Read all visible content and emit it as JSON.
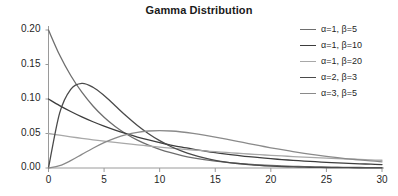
{
  "chart_data": {
    "type": "line",
    "title": "Gamma Distribution",
    "xlabel": "",
    "ylabel": "",
    "xlim": [
      0,
      30
    ],
    "ylim": [
      0,
      0.2
    ],
    "grid": false,
    "legend_position": "right",
    "xticks": [
      "0",
      "5",
      "10",
      "15",
      "20",
      "25",
      "30"
    ],
    "xtick_values": [
      0,
      5,
      10,
      15,
      20,
      25,
      30
    ],
    "yticks": [
      "0.00",
      "0.05",
      "0.10",
      "0.15",
      "0.20"
    ],
    "ytick_values": [
      0.0,
      0.05,
      0.1,
      0.15,
      0.2
    ],
    "x": [
      0,
      1,
      2,
      3,
      4,
      5,
      6,
      7,
      8,
      9,
      10,
      11,
      12,
      13,
      14,
      15,
      16,
      17,
      18,
      19,
      20,
      21,
      22,
      23,
      24,
      25,
      26,
      27,
      28,
      29,
      30
    ],
    "series": [
      {
        "name": "α=1, β=5",
        "color": "#6e6e6e",
        "values": [
          0.2,
          0.1637,
          0.134,
          0.1098,
          0.0899,
          0.0736,
          0.0602,
          0.0493,
          0.0404,
          0.0331,
          0.0271,
          0.0222,
          0.0181,
          0.0148,
          0.0122,
          0.01,
          0.0082,
          0.0067,
          0.0055,
          0.0045,
          0.0037,
          0.003,
          0.0025,
          0.002,
          0.0016,
          0.0013,
          0.0011,
          0.0009,
          0.0007,
          0.0006,
          0.0005
        ]
      },
      {
        "name": "α=1, β=10",
        "color": "#3d3d3d",
        "values": [
          0.1,
          0.0905,
          0.0819,
          0.0741,
          0.067,
          0.0607,
          0.0549,
          0.0497,
          0.0449,
          0.0407,
          0.0368,
          0.0333,
          0.0301,
          0.0273,
          0.0247,
          0.0223,
          0.0202,
          0.0183,
          0.0165,
          0.015,
          0.0135,
          0.0122,
          0.0111,
          0.01,
          0.0091,
          0.0082,
          0.0074,
          0.0067,
          0.0061,
          0.0055,
          0.005
        ]
      },
      {
        "name": "α=1, β=20",
        "color": "#a8a8a8",
        "values": [
          0.05,
          0.0476,
          0.0452,
          0.043,
          0.0409,
          0.0389,
          0.037,
          0.0352,
          0.0335,
          0.0319,
          0.0303,
          0.0288,
          0.0274,
          0.0261,
          0.0248,
          0.0236,
          0.0225,
          0.0214,
          0.0203,
          0.0193,
          0.0184,
          0.0175,
          0.0166,
          0.0158,
          0.0151,
          0.0143,
          0.0136,
          0.013,
          0.0123,
          0.0117,
          0.0112
        ]
      },
      {
        "name": "α=2, β=3",
        "color": "#4a4a4a",
        "values": [
          0.0,
          0.0796,
          0.1141,
          0.1226,
          0.117,
          0.105,
          0.0902,
          0.0753,
          0.0616,
          0.0497,
          0.0396,
          0.0312,
          0.0244,
          0.0189,
          0.0146,
          0.0112,
          0.0085,
          0.0065,
          0.0049,
          0.0037,
          0.0028,
          0.0021,
          0.0016,
          0.0012,
          0.0009,
          0.0007,
          0.0005,
          0.0004,
          0.0003,
          0.0002,
          0.0002
        ]
      },
      {
        "name": "α=3, β=5",
        "color": "#8a8a8a",
        "values": [
          0.0,
          0.0033,
          0.0107,
          0.0197,
          0.0287,
          0.0368,
          0.0434,
          0.0484,
          0.0517,
          0.0536,
          0.0541,
          0.0536,
          0.0522,
          0.0501,
          0.0476,
          0.0448,
          0.0417,
          0.0386,
          0.0354,
          0.0323,
          0.0293,
          0.0265,
          0.0238,
          0.0213,
          0.019,
          0.0169,
          0.015,
          0.0132,
          0.0117,
          0.0103,
          0.009
        ]
      }
    ]
  },
  "axis": {
    "line_color": "#9a9a9a",
    "tick_color": "#9a9a9a"
  }
}
